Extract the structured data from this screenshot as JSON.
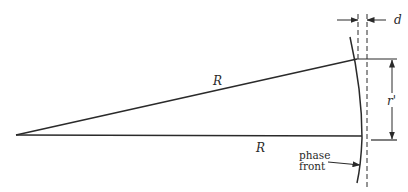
{
  "diagram": {
    "type": "geometry",
    "labels": {
      "upper_radius": "R",
      "lower_radius": "R",
      "offset_height": "r'",
      "sag": "d",
      "phase_front_line1": "phase",
      "phase_front_line2": "front"
    },
    "colors": {
      "line": "#2a2a2a",
      "background": "#ffffff"
    }
  }
}
